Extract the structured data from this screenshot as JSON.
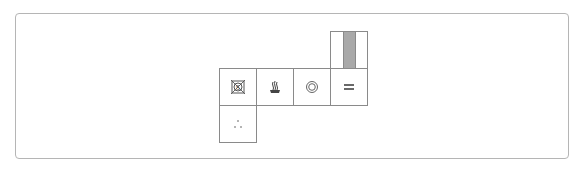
{
  "care_grid": {
    "colors": {
      "border": "#8a8a8a",
      "frame": "#b5b5b5",
      "bar": "#a9a9a9",
      "icon": "#555555"
    },
    "cells": [
      {
        "name": "do-not-tumble-dry-s",
        "icon": "crossed-square-circle-s-icon",
        "label": "S"
      },
      {
        "name": "steam-iron",
        "icon": "steam-icon"
      },
      {
        "name": "dry-clean-circle",
        "icon": "double-circle-icon"
      },
      {
        "name": "dry-flat",
        "icon": "equals-lines-icon"
      },
      {
        "name": "level-bar",
        "icon": "gray-bar-icon"
      },
      {
        "name": "dots",
        "icon": "three-dots-icon"
      }
    ]
  }
}
